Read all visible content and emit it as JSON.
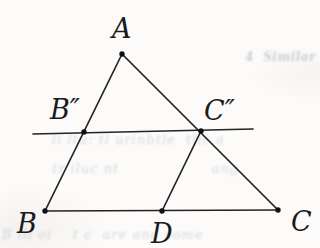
{
  "figure": {
    "line_color": "#232323",
    "line_width": 1.7,
    "dot_color": "#111111",
    "dot_radius": 2.7,
    "label_font_size": 27,
    "points": [
      {
        "id": "A",
        "x": 122,
        "y": 54,
        "label": "A",
        "label_x": 112,
        "label_baseline": 38
      },
      {
        "id": "B",
        "x": 45,
        "y": 211,
        "label": "B",
        "label_x": 17,
        "label_baseline": 233
      },
      {
        "id": "C",
        "x": 278,
        "y": 210,
        "label": "C",
        "label_x": 291,
        "label_baseline": 231
      },
      {
        "id": "D",
        "x": 162,
        "y": 211,
        "label": "D",
        "label_x": 151,
        "label_baseline": 243
      },
      {
        "id": "B2",
        "x": 84,
        "y": 132,
        "label": "B″",
        "label_x": 50,
        "label_baseline": 119
      },
      {
        "id": "C2",
        "x": 201,
        "y": 131,
        "label": "C″",
        "label_x": 204,
        "label_baseline": 120
      }
    ],
    "segments": [
      {
        "from": "A",
        "to": "B",
        "name": "side-AB"
      },
      {
        "from": "A",
        "to": "C",
        "name": "side-AC"
      },
      {
        "from": "B",
        "to": "C",
        "name": "side-BC"
      },
      {
        "from": "D",
        "to": "C2",
        "name": "cevian-D-Cpp"
      }
    ],
    "transversal": {
      "name": "transversal-Bpp-Cpp",
      "x1": 33,
      "y1": 134,
      "x2": 253,
      "y2": 129
    }
  },
  "ghost_text": [
    {
      "id": "g1",
      "text": "4  Similar Triangl",
      "left": 245,
      "top": 50,
      "width": 75,
      "size": 12,
      "heading": true
    },
    {
      "id": "g2",
      "text": "li ltu: tl urinbtle  tlic a",
      "left": 52,
      "top": 132,
      "width": 268,
      "size": 13,
      "heading": false
    },
    {
      "id": "g3",
      "text": "tr iluc nt                  ang",
      "left": 52,
      "top": 161,
      "width": 268,
      "size": 13,
      "heading": false
    },
    {
      "id": "g4",
      "text": "B lll oi    t c  are and some",
      "left": 2,
      "top": 227,
      "width": 318,
      "size": 13,
      "heading": false
    }
  ]
}
